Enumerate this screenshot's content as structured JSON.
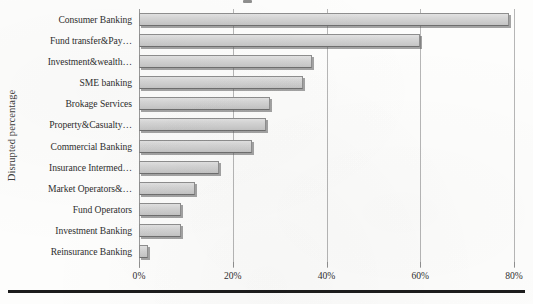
{
  "chart_data": {
    "type": "bar",
    "orientation": "horizontal",
    "title": "",
    "xlabel": "",
    "ylabel": "Disrupted percentage",
    "xlim": [
      0,
      80
    ],
    "xticks": [
      "0%",
      "20%",
      "40%",
      "60%",
      "80%"
    ],
    "xtick_values": [
      0,
      20,
      40,
      60,
      80
    ],
    "grid": "vertical",
    "legend": "none",
    "categories": [
      "Consumer Banking",
      "Fund transfer&Pay…",
      "Investment&wealth…",
      "SME banking",
      "Brokage Services",
      "Property&Casualty…",
      "Commercial Banking",
      "Insurance Intermed…",
      "Market Operators&…",
      "Fund Operators",
      "Investment Banking",
      "Reinsurance Banking"
    ],
    "values": [
      79,
      60,
      37,
      35,
      28,
      27,
      24,
      17,
      12,
      9,
      9,
      2
    ],
    "bar_fill": "#d4d4d4",
    "bar_border": "#8e8e8e",
    "grid_color": "#b6b6b6"
  },
  "axis": {
    "y_title": "Disrupted percentage"
  }
}
